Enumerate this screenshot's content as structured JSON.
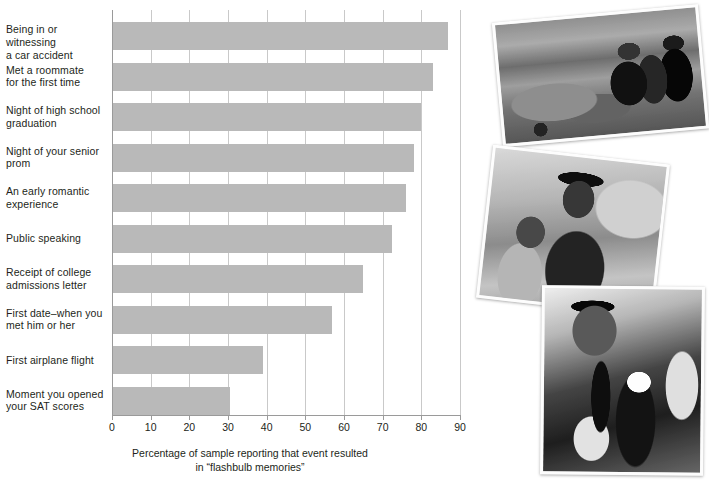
{
  "chart_data": {
    "type": "bar",
    "orientation": "horizontal",
    "title": "",
    "xlabel": "Percentage of sample reporting that event resulted in “flashbulb memories”",
    "xlabel_line1": "Percentage of sample reporting that event resulted",
    "xlabel_line2": "in “flashbulb memories”",
    "ylabel": "",
    "xlim": [
      0,
      90
    ],
    "xticks": [
      0,
      10,
      20,
      30,
      40,
      50,
      60,
      70,
      80,
      90
    ],
    "xtick_labels": [
      "0",
      "10",
      "20",
      "30",
      "40",
      "50",
      "60",
      "70",
      "80",
      "90"
    ],
    "grid": "vertical",
    "legend": "none",
    "bar_color": "#b9b9b9",
    "categories": [
      "Being in or witnessing a car accident",
      "Met a roommate for the first time",
      "Night of high school graduation",
      "Night of your senior prom",
      "An early romantic experience",
      "Public speaking",
      "Receipt of college admissions letter",
      "First date–when you met him or her",
      "First airplane flight",
      "Moment you opened your SAT scores"
    ],
    "category_lines": [
      [
        "Being in or witnessing",
        "a car accident"
      ],
      [
        "Met a roommate",
        "for the first time"
      ],
      [
        "Night of high school",
        "graduation"
      ],
      [
        "Night of your senior",
        "prom"
      ],
      [
        "An early romantic",
        "experience"
      ],
      [
        "Public speaking"
      ],
      [
        "Receipt of college",
        "admissions letter"
      ],
      [
        "First date–when you",
        "met him or her"
      ],
      [
        "First airplane flight"
      ],
      [
        "Moment you opened",
        "your SAT scores"
      ]
    ],
    "values": [
      87,
      83,
      80,
      78,
      76,
      72.5,
      65,
      57,
      39,
      30.5
    ]
  },
  "photos": [
    {
      "name": "car-accident-photo",
      "caption": "Black and white photo of a car accident with a damaged car and people standing on a street"
    },
    {
      "name": "graduation-photo",
      "caption": "Black and white photo of a smiling graduate in cap and gown hugging a woman"
    },
    {
      "name": "prom-photo",
      "caption": "Black and white photo of a young man in a suit having a boutonniere pinned on"
    }
  ]
}
